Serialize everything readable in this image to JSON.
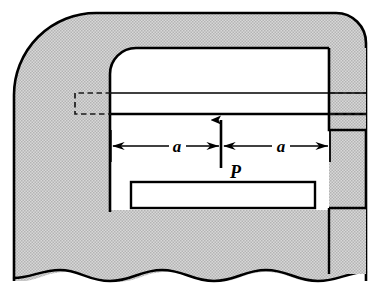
{
  "figure": {
    "background_color": "#ffffff",
    "body_fill_color": "#c9c9c9",
    "outline_color": "#000000",
    "cavity_fill_color": "#ffffff"
  },
  "labels": {
    "dimension_left": "a",
    "dimension_right": "a",
    "force": "P"
  },
  "annotations": {
    "dimension_left_name": "distance-a-left",
    "dimension_right_name": "distance-a-right",
    "force_name": "applied-load-P",
    "force_direction": "up",
    "break_line": "wavy",
    "hidden_edges": "dashed"
  },
  "geometry": {
    "outer_left": 14,
    "outer_right": 366,
    "outer_top": 12,
    "outer_bottom": 274,
    "cavity_left": 110,
    "cavity_right": 329,
    "cavity_top": 48,
    "dimension_line_y": 146,
    "center_x": 221
  }
}
